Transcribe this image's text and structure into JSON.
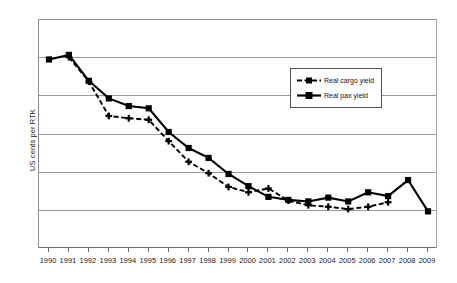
{
  "chart_data": {
    "type": "line",
    "title": "",
    "xlabel": "",
    "ylabel": "US cents per RTK",
    "grid": true,
    "legend_position": "inside-top-right",
    "x": [
      1990,
      1991,
      1992,
      1993,
      1994,
      1995,
      1996,
      1997,
      1998,
      1999,
      2000,
      2001,
      2002,
      2003,
      2004,
      2005,
      2006,
      2007,
      2008,
      2009
    ],
    "categories": [
      "1990",
      "1991",
      "1992",
      "1993",
      "1994",
      "1995",
      "1996",
      "1997",
      "1998",
      "1999",
      "2000",
      "2001",
      "2002",
      "2003",
      "2004",
      "2005",
      "2006",
      "2007",
      "2008",
      "2009"
    ],
    "yaxis": {
      "ticks_labeled": false,
      "gridline_count": 7,
      "interval_count": 6,
      "ylim": [
        0,
        6
      ]
    },
    "series": [
      {
        "name": "Real cargo yield",
        "style": "dashed",
        "marker": "cross",
        "color": "#000000",
        "values": [
          null,
          5.0,
          4.36,
          3.46,
          3.4,
          3.36,
          2.8,
          2.26,
          1.96,
          1.6,
          1.46,
          1.56,
          1.24,
          1.12,
          1.08,
          1.02,
          1.08,
          1.2,
          null,
          null
        ]
      },
      {
        "name": "Real pax yield",
        "style": "solid",
        "marker": "square",
        "color": "#000000",
        "values": [
          4.94,
          5.06,
          4.38,
          3.92,
          3.72,
          3.66,
          3.04,
          2.62,
          2.36,
          1.94,
          1.62,
          1.34,
          1.26,
          1.22,
          1.32,
          1.22,
          1.46,
          1.36,
          1.78,
          0.96
        ]
      }
    ],
    "legend": [
      {
        "label": "Real cargo yield",
        "style": "dashed",
        "marker": "cross"
      },
      {
        "label": "Real pax yield",
        "style": "solid",
        "marker": "square"
      }
    ]
  },
  "axis": {
    "y_title": "US cents per RTK"
  }
}
